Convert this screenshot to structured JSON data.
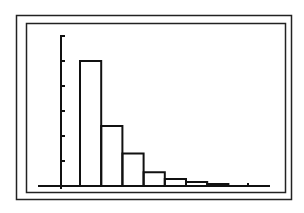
{
  "chart_data": {
    "type": "bar",
    "title": "",
    "xlabel": "",
    "ylabel": "",
    "categories": [
      "1",
      "2",
      "3",
      "4",
      "5",
      "6",
      "7"
    ],
    "values": [
      5.0,
      2.4,
      1.3,
      0.55,
      0.28,
      0.16,
      0.08
    ],
    "ylim": [
      0,
      6
    ],
    "y_ticks": [
      1,
      2,
      3,
      4,
      5,
      6
    ],
    "grid": false,
    "legend": null,
    "histogram": true
  },
  "colors": {
    "stroke": "#111111",
    "background": "#ffffff"
  }
}
